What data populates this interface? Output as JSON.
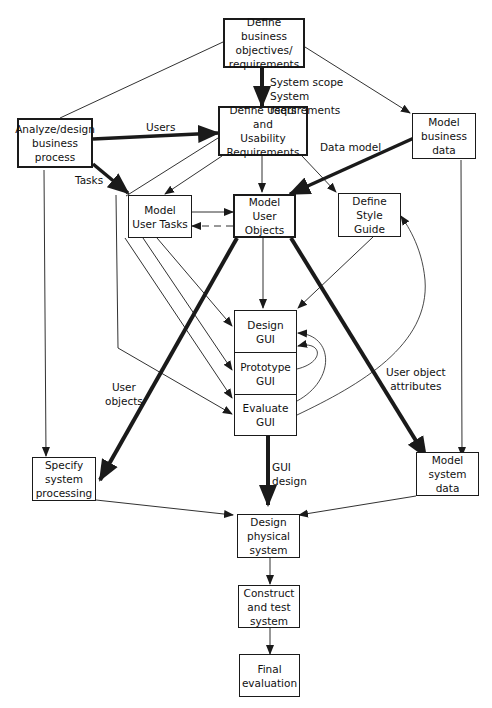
{
  "diagram": {
    "nodes": {
      "define_business": {
        "label": "Define business\nobjectives/\nrequirements"
      },
      "analyze_design": {
        "label": "Analyze/design\nbusiness\nprocess"
      },
      "define_users": {
        "label": "Define Users and\nUsability\nRequirements"
      },
      "model_business_data": {
        "label": "Model\nbusiness\ndata"
      },
      "model_user_tasks": {
        "label": "Model\nUser Tasks"
      },
      "model_user_objects": {
        "label": "Model\nUser\nObjects"
      },
      "define_style_guide": {
        "label": "Define\nStyle\nGuide"
      },
      "design_gui": {
        "label": "Design GUI"
      },
      "prototype_gui": {
        "label": "Prototype\nGUI"
      },
      "evaluate_gui": {
        "label": "Evaluate GUI"
      },
      "specify_system_processing": {
        "label": "Specify\nsystem\nprocessing"
      },
      "model_system_data": {
        "label": "Model\nsystem\ndata"
      },
      "design_physical_system": {
        "label": "Design\nphysical\nsystem"
      },
      "construct_test_system": {
        "label": "Construct\nand test\nsystem"
      },
      "final_evaluation": {
        "label": "Final\nevaluation"
      }
    },
    "edge_labels": {
      "system_scope": "System scope\nSystem requirements",
      "users": "Users",
      "tasks": "Tasks",
      "data_model": "Data model",
      "user_objects": "User\nobjects",
      "user_object_attributes": "User object\nattributes",
      "gui_design": "GUI\ndesign"
    },
    "colors": {
      "line": "#1a1a1a",
      "background": "#ffffff"
    }
  }
}
